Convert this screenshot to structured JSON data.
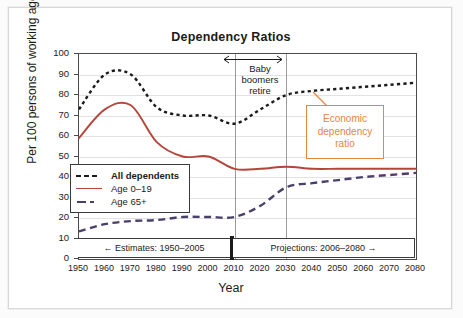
{
  "chart_data": {
    "type": "line",
    "title": "Dependency Ratios",
    "xlabel": "Year",
    "ylabel": "Per 100 persons of working age",
    "xlim": [
      1950,
      2080
    ],
    "ylim": [
      0,
      100
    ],
    "ytick_step": 10,
    "xtick_step": 10,
    "grid": true,
    "legend_position": "inside-lower-left",
    "x": [
      1950,
      1960,
      1970,
      1980,
      1990,
      2000,
      2010,
      2020,
      2030,
      2040,
      2050,
      2060,
      2070,
      2080
    ],
    "xticks": [
      "1950",
      "1960",
      "1970",
      "1980",
      "1990",
      "2000",
      "2010",
      "2020",
      "2030",
      "2040",
      "2050",
      "2060",
      "2070",
      "2080"
    ],
    "yticks": [
      "0",
      "10",
      "20",
      "30",
      "40",
      "50",
      "60",
      "70",
      "80",
      "90",
      "100"
    ],
    "series": [
      {
        "name": "All dependents",
        "color": "#1b1b1b",
        "style": "dotted",
        "values": [
          73,
          90,
          90,
          74,
          70,
          70,
          66,
          73,
          80,
          82,
          83,
          84,
          85,
          86
        ]
      },
      {
        "name": "Age 0–19",
        "color": "#B5453A",
        "style": "solid",
        "values": [
          59,
          73,
          75,
          57,
          50,
          50,
          44,
          44,
          45,
          44,
          44,
          44,
          44,
          44
        ]
      },
      {
        "name": "Age 65+",
        "color": "#4A3F6B",
        "style": "dashed",
        "values": [
          13.5,
          17,
          18.5,
          19,
          20.5,
          20.5,
          20.5,
          26,
          35,
          37,
          38.5,
          40,
          41,
          42
        ]
      }
    ],
    "annotations": [
      {
        "name": "baby-boomers-retire",
        "text": "Baby boomers retire",
        "lines": [
          "Baby",
          "boomers",
          "retire"
        ],
        "span_start": 2010,
        "span_end": 2030,
        "type": "span-arrow"
      },
      {
        "name": "economic-dependency-ratio",
        "text": "Economic dependency ratio",
        "lines": [
          "Economic",
          "dependency",
          "ratio"
        ],
        "color": "#E8843C",
        "points_to_series": "All dependents",
        "type": "callout-box"
      },
      {
        "name": "estimates-range",
        "text": "← Estimates: 1950–2005",
        "range_start": 1950,
        "range_end": 2005,
        "type": "range-box"
      },
      {
        "name": "projections-range",
        "text": "Projections: 2006–2080 →",
        "range_start": 2006,
        "range_end": 2080,
        "type": "range-box"
      }
    ],
    "vertical_markers": [
      2010,
      2030
    ]
  },
  "legend": {
    "items": [
      {
        "label": "All dependents",
        "color": "#1b1b1b",
        "style": "dotted"
      },
      {
        "label": "Age 0–19",
        "color": "#B5453A",
        "style": "solid"
      },
      {
        "label": "Age 65+",
        "color": "#4A3F6B",
        "style": "dashed"
      }
    ]
  },
  "colors": {
    "all_dependents": "#1b1b1b",
    "age_0_19": "#B5453A",
    "age_65_plus": "#4A3F6B",
    "callout": "#E8843C",
    "grid": "#e2e2e2",
    "axis": "#4a4a4a"
  }
}
